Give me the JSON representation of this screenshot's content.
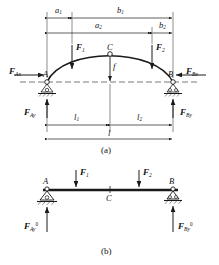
{
  "figure": {
    "title_caption_a": "(a)",
    "title_caption_b": "(b)",
    "colors": {
      "line": "#1a1a1a",
      "dashed_axis": "#555555",
      "background": "#ffffff",
      "hatch": "#333333"
    }
  },
  "panel_a": {
    "name": "three-hinged-arch-free-body-diagram",
    "dimensions": [
      {
        "id": "a1",
        "label": "a",
        "subscript": "1",
        "chain": "top",
        "from": "left-springing-A",
        "to": "load-F1-line"
      },
      {
        "id": "b1",
        "label": "b",
        "subscript": "1",
        "chain": "top",
        "from": "load-F1-line",
        "to": "right-springing-B"
      },
      {
        "id": "a2",
        "label": "a",
        "subscript": "2",
        "chain": "second",
        "from": "left-springing-A",
        "to": "load-F2-line"
      },
      {
        "id": "b2",
        "label": "b",
        "subscript": "2",
        "chain": "second",
        "from": "load-F2-line",
        "to": "right-springing-B"
      },
      {
        "id": "l1",
        "label": "l",
        "subscript": "1",
        "chain": "bottom",
        "from": "left-springing-A",
        "to": "crown-C"
      },
      {
        "id": "l2",
        "label": "l",
        "subscript": "2",
        "chain": "bottom",
        "from": "crown-C",
        "to": "right-springing-B"
      },
      {
        "id": "l",
        "label": "l",
        "subscript": "",
        "chain": "total-span",
        "from": "left-springing-A",
        "to": "right-springing-B"
      },
      {
        "id": "f",
        "label": "f",
        "subscript": "",
        "chain": "rise",
        "from": "crown-C",
        "to": "springing-line"
      }
    ],
    "points": [
      {
        "id": "A",
        "label": "A",
        "kind": "pin-support"
      },
      {
        "id": "B",
        "label": "B",
        "kind": "roller-support"
      },
      {
        "id": "C",
        "label": "C",
        "kind": "crown-hinge"
      }
    ],
    "loads": [
      {
        "id": "F1",
        "label": "F",
        "subscript": "1",
        "direction": "down"
      },
      {
        "id": "F2",
        "label": "F",
        "subscript": "2",
        "direction": "down"
      }
    ],
    "reactions": [
      {
        "id": "FAx",
        "label": "F",
        "subscript": "Ax",
        "direction": "right",
        "position": "left-outside"
      },
      {
        "id": "FBx",
        "label": "F",
        "subscript": "Bx",
        "direction": "left",
        "position": "right-outside"
      },
      {
        "id": "FAy",
        "label": "F",
        "subscript": "Ay",
        "direction": "up",
        "position": "left-below"
      },
      {
        "id": "FBy",
        "label": "F",
        "subscript": "By",
        "direction": "up",
        "position": "right-below"
      }
    ]
  },
  "panel_b": {
    "name": "equivalent-simply-supported-beam",
    "points": [
      {
        "id": "A",
        "label": "A",
        "kind": "pin-support"
      },
      {
        "id": "B",
        "label": "B",
        "kind": "roller-support"
      },
      {
        "id": "C",
        "label": "C",
        "kind": "midspan-marker"
      }
    ],
    "loads": [
      {
        "id": "F1",
        "label": "F",
        "subscript": "1",
        "direction": "down"
      },
      {
        "id": "F2",
        "label": "F",
        "subscript": "2",
        "direction": "down"
      }
    ],
    "reactions": [
      {
        "id": "FAy0",
        "label": "F",
        "subscript": "Ay",
        "superscript": "0",
        "direction": "up",
        "position": "left-below"
      },
      {
        "id": "FBy0",
        "label": "F",
        "subscript": "By",
        "superscript": "0",
        "direction": "up",
        "position": "right-below"
      }
    ]
  }
}
